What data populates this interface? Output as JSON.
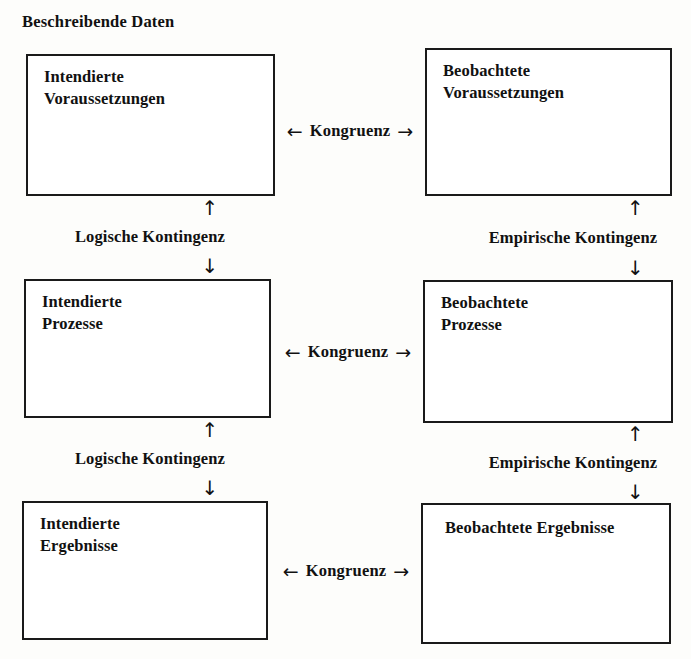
{
  "title": "Beschreibende Daten",
  "columns": {
    "left": "Intendiert",
    "right": "Beobachtet"
  },
  "nodes": [
    {
      "id": "intendierte-voraussetzungen",
      "label": "Intendierte\nVoraussetzungen",
      "column": "left",
      "row": 1
    },
    {
      "id": "beobachtete-voraussetzungen",
      "label": "Beobachtete\nVoraussetzungen",
      "column": "right",
      "row": 1
    },
    {
      "id": "intendierte-prozesse",
      "label": "Intendierte\nProzesse",
      "column": "left",
      "row": 2
    },
    {
      "id": "beobachtete-prozesse",
      "label": "Beobachtete\nProzesse",
      "column": "right",
      "row": 2
    },
    {
      "id": "intendierte-ergebnisse",
      "label": "Intendierte\nErgebnisse",
      "column": "left",
      "row": 3
    },
    {
      "id": "beobachtete-ergebnisse",
      "label": "Beobachtete Ergebnisse",
      "column": "right",
      "row": 3
    }
  ],
  "horizontal_links": [
    {
      "id": "kongruenz-voraussetzungen",
      "label": "Kongruenz",
      "left_arrow": "←",
      "right_arrow": "→"
    },
    {
      "id": "kongruenz-prozesse",
      "label": "Kongruenz",
      "left_arrow": "←",
      "right_arrow": "→"
    },
    {
      "id": "kongruenz-ergebnisse",
      "label": "Kongruenz",
      "left_arrow": "←",
      "right_arrow": "→"
    }
  ],
  "vertical_links": [
    {
      "id": "logische-kontingenz-1",
      "label": "Logische Kontingenz",
      "up_arrow": "↑",
      "down_arrow": "↓"
    },
    {
      "id": "empirische-kontingenz-1",
      "label": "Empirische Kontingenz",
      "up_arrow": "↑",
      "down_arrow": "↓"
    },
    {
      "id": "logische-kontingenz-2",
      "label": "Logische Kontingenz",
      "up_arrow": "↑",
      "down_arrow": "↓"
    },
    {
      "id": "empirische-kontingenz-2",
      "label": "Empirische Kontingenz",
      "up_arrow": "↑",
      "down_arrow": "↓"
    }
  ],
  "colors": {
    "ink": "#1a1a1a",
    "paper": "#fdfdfb",
    "box_fill": "#ffffff"
  }
}
